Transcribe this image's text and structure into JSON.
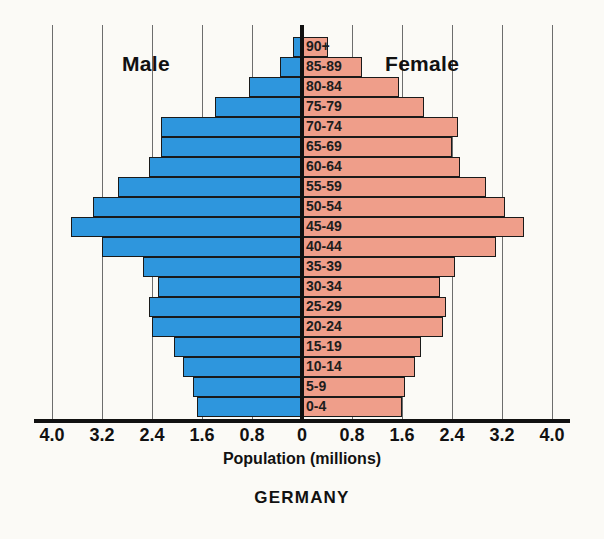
{
  "chart_data": {
    "type": "bar",
    "subtype": "population-pyramid",
    "title": "GERMANY",
    "xlabel": "Population (millions)",
    "ylabel": "",
    "grid": true,
    "legend_position": "in-plot",
    "axis": {
      "zero_px": 302,
      "px_per_unit": 62.5,
      "xlim": [
        -4.0,
        4.0
      ],
      "tick_values": [
        -4.0,
        -3.2,
        -2.4,
        -1.6,
        -0.8,
        0,
        0.8,
        1.6,
        2.4,
        3.2,
        4.0
      ],
      "tick_labels": [
        "4.0",
        "3.2",
        "2.4",
        "1.6",
        "0.8",
        "0",
        "0.8",
        "1.6",
        "2.4",
        "3.2",
        "4.0"
      ]
    },
    "side_labels": {
      "left": "Male",
      "right": "Female"
    },
    "categories": [
      "90+",
      "85-89",
      "80-84",
      "75-79",
      "70-74",
      "65-69",
      "60-64",
      "55-59",
      "50-54",
      "45-49",
      "40-44",
      "35-39",
      "30-34",
      "25-29",
      "20-24",
      "15-19",
      "10-14",
      "5-9",
      "0-4"
    ],
    "series": [
      {
        "name": "Male",
        "color": "#2e96dd",
        "values": [
          0.15,
          0.35,
          0.85,
          1.4,
          2.25,
          2.25,
          2.45,
          2.95,
          3.35,
          3.7,
          3.2,
          2.55,
          2.3,
          2.45,
          2.4,
          2.05,
          1.9,
          1.75,
          1.68
        ]
      },
      {
        "name": "Female",
        "color": "#ef9e8a",
        "values": [
          0.42,
          0.96,
          1.55,
          1.95,
          2.5,
          2.4,
          2.52,
          2.95,
          3.25,
          3.55,
          3.1,
          2.45,
          2.2,
          2.3,
          2.25,
          1.9,
          1.8,
          1.65,
          1.6
        ]
      }
    ]
  }
}
